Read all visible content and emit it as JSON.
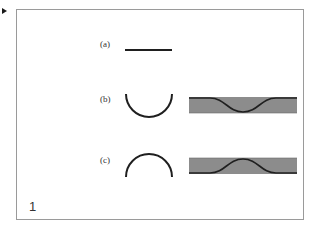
{
  "figure": {
    "number": "1",
    "panels": [
      {
        "id": "a",
        "label": "(a)",
        "shape": "flat line"
      },
      {
        "id": "b",
        "label": "(b)",
        "shape": "concave arc (U)",
        "band": "gray band with downward dip"
      },
      {
        "id": "c",
        "label": "(c)",
        "shape": "convex arc (dome)",
        "band": "gray band with upward bump"
      }
    ],
    "colors": {
      "band_fill": "#8c8c8c",
      "stroke": "#1f1f1f",
      "frame": "#9a9a9a"
    }
  }
}
